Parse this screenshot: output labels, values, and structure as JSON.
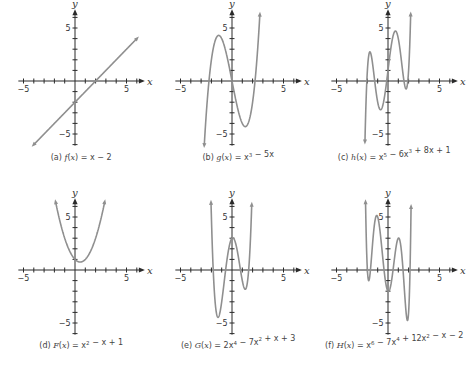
{
  "figure": {
    "colors": {
      "axis": "#2a2a2a",
      "curve": "#8f8f8f",
      "text": "#444444",
      "background": "#ffffff"
    }
  },
  "chart_data": [
    {
      "type": "line",
      "id": "a",
      "title": "(a) f(x) = x − 2",
      "caption": {
        "prefix": "(a) ",
        "fname": "f",
        "expr_parts": [
          [
            "x − 2",
            ""
          ]
        ]
      },
      "function": "x - 2",
      "coefficients_desc": [
        1,
        -2
      ],
      "xlabel": "x",
      "ylabel": "y",
      "xlim": [
        -6,
        6
      ],
      "ylim": [
        -6,
        6
      ],
      "xticks": [
        -5,
        5
      ],
      "yticks": [
        5,
        -5
      ],
      "domain_plotted": [
        -4,
        6
      ],
      "key_points": {
        "x_intercept": 2,
        "y_intercept": -2
      }
    },
    {
      "type": "line",
      "id": "b",
      "title": "(b) g(x) = x³ − 5x",
      "caption": {
        "prefix": "(b) ",
        "fname": "g",
        "expr_parts": [
          [
            "x",
            "3"
          ],
          [
            " − 5x",
            ""
          ]
        ]
      },
      "function": "x^3 - 5x",
      "coefficients_desc": [
        1,
        0,
        -5,
        0
      ],
      "xlabel": "x",
      "ylabel": "y",
      "xlim": [
        -6,
        6
      ],
      "ylim": [
        -6,
        6
      ],
      "xticks": [
        -5,
        5
      ],
      "yticks": [
        5,
        -5
      ],
      "key_points": {
        "local_max": [
          -1.29,
          4.3
        ],
        "local_min": [
          1.29,
          -4.3
        ],
        "roots": [
          -2.24,
          0,
          2.24
        ]
      }
    },
    {
      "type": "line",
      "id": "c",
      "title": "(c) h(x) = x⁵ − 6x³ + 8x + 1",
      "caption": {
        "prefix": "(c) ",
        "fname": "h",
        "expr_parts": [
          [
            "x",
            "5"
          ],
          [
            " − 6x",
            "3"
          ],
          [
            " + 8x + 1",
            ""
          ]
        ]
      },
      "function": "x^5 - 6x^3 + 8x + 1",
      "coefficients_desc": [
        1,
        0,
        -6,
        0,
        8,
        1
      ],
      "xlabel": "x",
      "ylabel": "y",
      "xlim": [
        -6,
        6
      ],
      "ylim": [
        -6,
        6
      ],
      "xticks": [
        -5,
        5
      ],
      "yticks": [
        5,
        -5
      ],
      "key_points": {
        "local_max": [
          [
            -1.7,
            3.2
          ],
          [
            0.7,
            4.7
          ]
        ],
        "local_min": [
          [
            -0.7,
            -2.7
          ],
          [
            1.7,
            -1.2
          ]
        ]
      }
    },
    {
      "type": "line",
      "id": "d",
      "title": "(d) F(x) = x² − x + 1",
      "caption": {
        "prefix": "(d) ",
        "fname": "F",
        "expr_parts": [
          [
            "x",
            "2"
          ],
          [
            " − x + 1",
            ""
          ]
        ]
      },
      "function": "x^2 - x + 1",
      "coefficients_desc": [
        1,
        -1,
        1
      ],
      "xlabel": "x",
      "ylabel": "y",
      "xlim": [
        -6,
        6
      ],
      "ylim": [
        -6,
        6
      ],
      "xticks": [
        -5,
        5
      ],
      "yticks": [
        5,
        -5
      ],
      "key_points": {
        "vertex": [
          0.5,
          0.75
        ],
        "y_intercept": 1
      }
    },
    {
      "type": "line",
      "id": "e",
      "title": "(e) G(x) = 2x⁴ − 7x² + x + 3",
      "caption": {
        "prefix": "(e) ",
        "fname": "G",
        "expr_parts": [
          [
            "2x",
            "4"
          ],
          [
            " − 7x",
            "2"
          ],
          [
            " + x + 3",
            ""
          ]
        ]
      },
      "function": "2x^4 - 7x^2 + x + 3",
      "coefficients_desc": [
        2,
        0,
        -7,
        1,
        3
      ],
      "xlabel": "x",
      "ylabel": "y",
      "xlim": [
        -6,
        6
      ],
      "ylim": [
        -6,
        6
      ],
      "xticks": [
        -5,
        5
      ],
      "yticks": [
        5,
        -5
      ],
      "key_points": {
        "local_min": [
          [
            -1.39,
            -4.4
          ],
          [
            1.26,
            -1.9
          ]
        ],
        "local_max": [
          0.07,
          3.04
        ]
      }
    },
    {
      "type": "line",
      "id": "f",
      "title": "(f) H(x) = x⁶ − 7x⁴ + 12x² − x − 2",
      "caption": {
        "prefix": "(f) ",
        "fname": "H",
        "expr_parts": [
          [
            "x",
            "6"
          ],
          [
            " − 7x",
            "4"
          ],
          [
            " + 12x",
            "2"
          ],
          [
            " − x − 2",
            ""
          ]
        ]
      },
      "function": "x^6 - 7x^4 + 12x^2 - x - 2",
      "coefficients_desc": [
        1,
        0,
        -7,
        0,
        12,
        -1,
        -2
      ],
      "xlabel": "x",
      "ylabel": "y",
      "xlim": [
        -6,
        6
      ],
      "ylim": [
        -6,
        6
      ],
      "xticks": [
        -5,
        5
      ],
      "yticks": [
        5,
        -5
      ],
      "key_points": {
        "local_min": [
          [
            -1.87,
            -1.1
          ],
          [
            0.04,
            -2.0
          ],
          [
            1.87,
            -4.8
          ]
        ],
        "local_max": [
          [
            -1.13,
            5.2
          ],
          [
            1.13,
            3.0
          ]
        ]
      }
    }
  ],
  "layout": {
    "panels": [
      {
        "id": "a",
        "ox": 75,
        "oy": 81,
        "caption_y": 160
      },
      {
        "id": "b",
        "ox": 232,
        "oy": 81,
        "caption_y": 160
      },
      {
        "id": "c",
        "ox": 388,
        "oy": 81,
        "caption_y": 160
      },
      {
        "id": "d",
        "ox": 75,
        "oy": 270,
        "caption_y": 348
      },
      {
        "id": "e",
        "ox": 232,
        "oy": 270,
        "caption_y": 348
      },
      {
        "id": "f",
        "ox": 388,
        "oy": 270,
        "caption_y": 348
      }
    ],
    "ux": 10.3,
    "uy": 10.6
  }
}
